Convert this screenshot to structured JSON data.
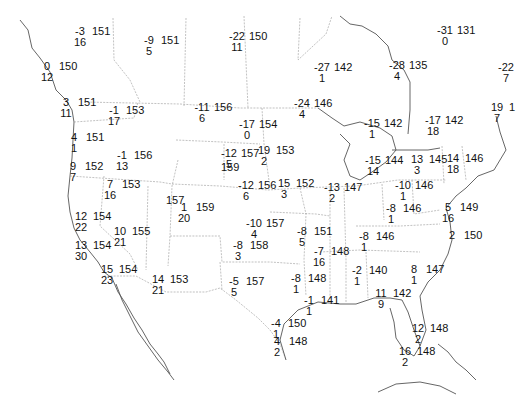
{
  "map": {
    "type": "surface station plot",
    "region": "North America (CONUS, southern Canada, northern Mexico)",
    "legend_note": "each station: upper-left = temperature, lower = dewpoint/other, right = pressure (3-digit)",
    "caption": ""
  },
  "stations": [
    {
      "id": "s1",
      "x": 80,
      "y": 32,
      "top": "-3",
      "bottom": "16",
      "right": "151"
    },
    {
      "id": "s2",
      "x": 149,
      "y": 41,
      "top": "-9",
      "bottom": "5",
      "right": "151"
    },
    {
      "id": "s3",
      "x": 237,
      "y": 37,
      "top": "-22",
      "bottom": "11",
      "right": "150"
    },
    {
      "id": "s4",
      "x": 47,
      "y": 67,
      "top": "0",
      "bottom": "12",
      "right": "150"
    },
    {
      "id": "s5",
      "x": 322,
      "y": 68,
      "top": "-27",
      "bottom": "1",
      "right": "142"
    },
    {
      "id": "s6",
      "x": 397,
      "y": 66,
      "top": "-28",
      "bottom": "4",
      "right": "135"
    },
    {
      "id": "s7",
      "x": 445,
      "y": 31,
      "top": "-31",
      "bottom": "0",
      "right": "131"
    },
    {
      "id": "s8",
      "x": 506,
      "y": 68,
      "top": "-22",
      "bottom": "7",
      "right": ""
    },
    {
      "id": "s9",
      "x": 66,
      "y": 103,
      "top": "3",
      "bottom": "11",
      "right": "151"
    },
    {
      "id": "s10",
      "x": 114,
      "y": 111,
      "top": "-1",
      "bottom": "17",
      "right": "153"
    },
    {
      "id": "s11",
      "x": 202,
      "y": 108,
      "top": "-11",
      "bottom": "6",
      "right": "156"
    },
    {
      "id": "s12",
      "x": 302,
      "y": 104,
      "top": "-24",
      "bottom": "4",
      "right": "146"
    },
    {
      "id": "s13",
      "x": 372,
      "y": 124,
      "top": "-15",
      "bottom": "1",
      "right": "142"
    },
    {
      "id": "s14",
      "x": 433,
      "y": 121,
      "top": "-17",
      "bottom": "18",
      "right": "142"
    },
    {
      "id": "s15",
      "x": 497,
      "y": 108,
      "top": "19",
      "bottom": "7",
      "right": "1"
    },
    {
      "id": "s16",
      "x": 74,
      "y": 138,
      "top": "4",
      "bottom": "1",
      "right": "151"
    },
    {
      "id": "s17",
      "x": 247,
      "y": 125,
      "top": "-17",
      "bottom": "0",
      "right": "154"
    },
    {
      "id": "s18",
      "x": 73,
      "y": 167,
      "top": "9",
      "bottom": "7",
      "right": "152"
    },
    {
      "id": "s19",
      "x": 122,
      "y": 156,
      "top": "-1",
      "bottom": "13",
      "right": "156"
    },
    {
      "id": "s20",
      "x": 229,
      "y": 154,
      "top": "-12",
      "bottom": "5",
      "right": "157"
    },
    {
      "id": "s21",
      "x": 264,
      "y": 151,
      "top": "19",
      "bottom": "2",
      "right": "153"
    },
    {
      "id": "s22",
      "x": 209,
      "y": 168,
      "top": "",
      "bottom": "",
      "right": "159"
    },
    {
      "id": "s23",
      "x": 373,
      "y": 161,
      "top": "-15",
      "bottom": "14",
      "right": "144"
    },
    {
      "id": "s24",
      "x": 417,
      "y": 160,
      "top": "13",
      "bottom": "3",
      "right": "145"
    },
    {
      "id": "s25",
      "x": 453,
      "y": 159,
      "top": "14",
      "bottom": "18",
      "right": "146"
    },
    {
      "id": "s26",
      "x": 110,
      "y": 185,
      "top": "7",
      "bottom": "16",
      "right": "153"
    },
    {
      "id": "s27",
      "x": 246,
      "y": 186,
      "top": "-12",
      "bottom": "6",
      "right": "156"
    },
    {
      "id": "s28",
      "x": 284,
      "y": 184,
      "top": "15",
      "bottom": "3",
      "right": "152"
    },
    {
      "id": "s29",
      "x": 332,
      "y": 188,
      "top": "-13",
      "bottom": "2",
      "right": "147"
    },
    {
      "id": "s30",
      "x": 403,
      "y": 186,
      "top": "-10",
      "bottom": "1",
      "right": "146"
    },
    {
      "id": "s31",
      "x": 154,
      "y": 201,
      "top": "",
      "bottom": "",
      "right": "157"
    },
    {
      "id": "s32",
      "x": 184,
      "y": 208,
      "top": "1",
      "bottom": "20",
      "right": "159"
    },
    {
      "id": "s33",
      "x": 81,
      "y": 217,
      "top": "12",
      "bottom": "22",
      "right": "154"
    },
    {
      "id": "s34",
      "x": 254,
      "y": 224,
      "top": "-10",
      "bottom": "4",
      "right": "157"
    },
    {
      "id": "s35",
      "x": 391,
      "y": 209,
      "top": "-8",
      "bottom": "1",
      "right": "146"
    },
    {
      "id": "s36",
      "x": 448,
      "y": 208,
      "top": "5",
      "bottom": "16",
      "right": "149"
    },
    {
      "id": "s37",
      "x": 120,
      "y": 232,
      "top": "10",
      "bottom": "21",
      "right": "155"
    },
    {
      "id": "s38",
      "x": 302,
      "y": 232,
      "top": "-8",
      "bottom": "5",
      "right": "151"
    },
    {
      "id": "s39",
      "x": 364,
      "y": 237,
      "top": "-8",
      "bottom": "1",
      "right": "146"
    },
    {
      "id": "s40",
      "x": 452,
      "y": 236,
      "top": "2",
      "bottom": "",
      "right": "150"
    },
    {
      "id": "s41",
      "x": 81,
      "y": 246,
      "top": "13",
      "bottom": "30",
      "right": "154"
    },
    {
      "id": "s42",
      "x": 238,
      "y": 246,
      "top": "-8",
      "bottom": "3",
      "right": "158"
    },
    {
      "id": "s43",
      "x": 319,
      "y": 252,
      "top": "-7",
      "bottom": "16",
      "right": "148"
    },
    {
      "id": "s44",
      "x": 107,
      "y": 270,
      "top": "15",
      "bottom": "23",
      "right": "154"
    },
    {
      "id": "s45",
      "x": 158,
      "y": 280,
      "top": "14",
      "bottom": "21",
      "right": "153"
    },
    {
      "id": "s46",
      "x": 234,
      "y": 282,
      "top": "-5",
      "bottom": "5",
      "right": "157"
    },
    {
      "id": "s47",
      "x": 296,
      "y": 279,
      "top": "-8",
      "bottom": "1",
      "right": "148"
    },
    {
      "id": "s48",
      "x": 357,
      "y": 271,
      "top": "-2",
      "bottom": "1",
      "right": "140"
    },
    {
      "id": "s49",
      "x": 414,
      "y": 270,
      "top": "8",
      "bottom": "1",
      "right": "147"
    },
    {
      "id": "s50",
      "x": 309,
      "y": 301,
      "top": "-1",
      "bottom": "1",
      "right": "141"
    },
    {
      "id": "s51",
      "x": 381,
      "y": 294,
      "top": "11",
      "bottom": "9",
      "right": "142"
    },
    {
      "id": "s52",
      "x": 276,
      "y": 324,
      "top": "-4",
      "bottom": "1",
      "right": "150"
    },
    {
      "id": "s53",
      "x": 277,
      "y": 342,
      "top": "4",
      "bottom": "2",
      "right": "148"
    },
    {
      "id": "s54",
      "x": 418,
      "y": 329,
      "top": "12",
      "bottom": "2",
      "right": "148"
    },
    {
      "id": "s55",
      "x": 405,
      "y": 352,
      "top": "16",
      "bottom": "2",
      "right": "148"
    }
  ]
}
